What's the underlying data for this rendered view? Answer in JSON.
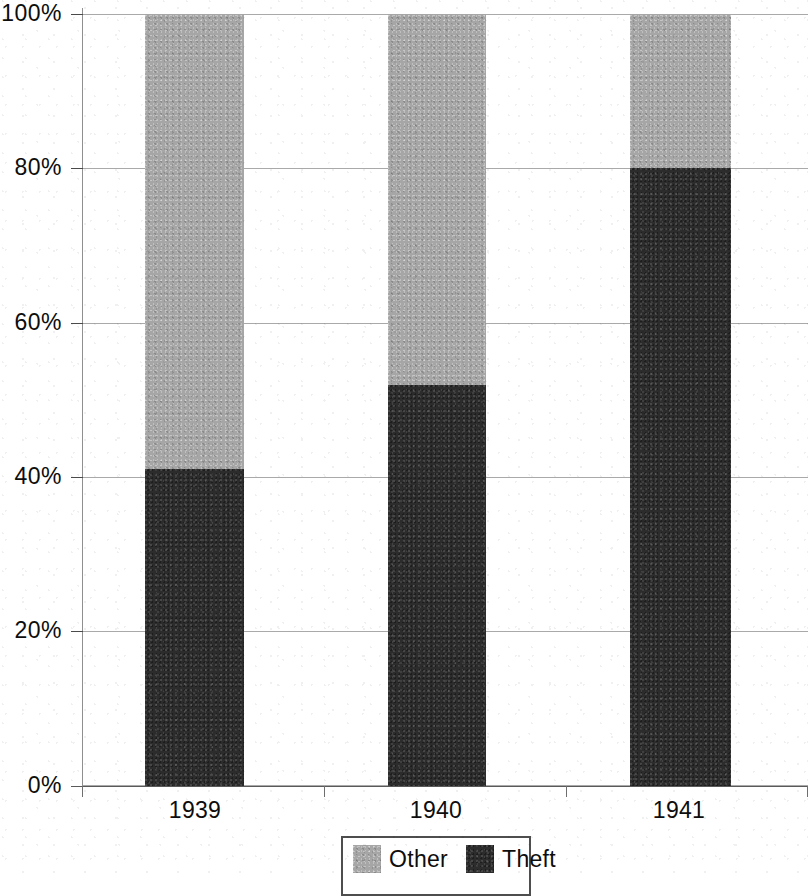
{
  "chart_data": {
    "type": "bar",
    "subtype": "stacked-100-percent",
    "title": "",
    "subtitle": "",
    "xlabel": "",
    "ylabel": "",
    "categories": [
      "1939",
      "1940",
      "1941"
    ],
    "series": [
      {
        "name": "Other",
        "color": "#a6a6a6",
        "values": [
          59,
          48,
          20
        ]
      },
      {
        "name": "Theft",
        "color": "#2c2c2c",
        "values": [
          41,
          52,
          80
        ]
      }
    ],
    "stack_order_bottom_to_top": [
      "Theft",
      "Other"
    ],
    "ylim": [
      0,
      100
    ],
    "y_tick_labels": [
      "0%",
      "20%",
      "40%",
      "60%",
      "80%",
      "100%"
    ],
    "y_tick_values": [
      0,
      20,
      40,
      60,
      80,
      100
    ],
    "grid": true,
    "grid_axis": "y",
    "legend_position": "bottom",
    "legend_entries": [
      "Other",
      "Theft"
    ]
  },
  "legend": {
    "items": [
      {
        "label": "Other",
        "color": "#a6a6a6"
      },
      {
        "label": "Theft",
        "color": "#2c2c2c"
      }
    ]
  },
  "colors": {
    "other": "#a6a6a6",
    "theft": "#2c2c2c",
    "grid": "#9a9a9a",
    "axis": "#5a5a5a",
    "text": "#0d0d0d",
    "background": "#ffffff"
  }
}
